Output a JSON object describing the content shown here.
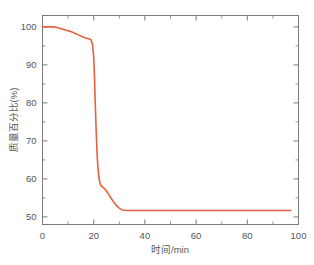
{
  "chart_data": {
    "type": "line",
    "title": "",
    "xlabel": "时间/min",
    "ylabel": "质量百分比(%)",
    "xlim": [
      0,
      100
    ],
    "ylim": [
      48,
      103
    ],
    "xticks": [
      0,
      20,
      40,
      60,
      80,
      100
    ],
    "xticklabels": [
      "0",
      "20",
      "40",
      "60",
      "80",
      "100"
    ],
    "yticks": [
      50,
      60,
      70,
      80,
      90,
      100
    ],
    "yticklabels": [
      "50",
      "60",
      "70",
      "80",
      "90",
      "100"
    ],
    "x_minor_interval": 10,
    "y_minor_interval": 5,
    "grid": false,
    "legend": null,
    "series": [
      {
        "name": "质量百分比",
        "color": "#e8603c",
        "x": [
          0,
          1,
          2,
          3,
          4,
          5,
          6,
          7,
          8,
          9,
          10,
          11,
          12,
          13,
          14,
          15,
          16,
          17,
          18,
          18.5,
          19,
          19.5,
          20,
          20.3,
          20.6,
          21,
          21.3,
          21.6,
          22,
          22.4,
          22.8,
          23.2,
          24,
          25,
          26,
          27,
          28,
          29,
          30,
          31,
          32,
          33,
          35,
          38,
          42,
          48,
          55,
          62,
          70,
          78,
          86,
          92,
          97
        ],
        "y": [
          100.0,
          100.0,
          100.0,
          100.0,
          100.0,
          99.9,
          99.8,
          99.6,
          99.4,
          99.2,
          99.0,
          98.8,
          98.5,
          98.2,
          97.9,
          97.6,
          97.3,
          97.1,
          96.9,
          96.8,
          96.5,
          95.5,
          92.0,
          87.0,
          80.0,
          72.0,
          67.0,
          63.5,
          60.5,
          59.0,
          58.3,
          58.0,
          57.6,
          56.8,
          55.8,
          54.7,
          53.7,
          52.9,
          52.3,
          51.9,
          51.75,
          51.7,
          51.7,
          51.7,
          51.7,
          51.7,
          51.7,
          51.7,
          51.7,
          51.7,
          51.7,
          51.7,
          51.7
        ]
      }
    ]
  },
  "axes": {
    "x_axis_name": "time-axis",
    "y_axis_name": "mass-percent-axis"
  }
}
